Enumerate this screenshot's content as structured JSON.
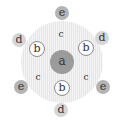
{
  "diagram": {
    "type": "hexagonal-cluster",
    "colors": {
      "a_fill": "#9b9b9b",
      "b_fill": "#ffffff",
      "b_stroke": "#8a8a8a",
      "d_fill": "#d6d6d6",
      "e_fill": "#b4b4b4",
      "background_ring": "#ececec"
    },
    "center": {
      "label": "a",
      "x": 62,
      "y": 62,
      "r": 12
    },
    "b_nodes": [
      {
        "label": "b",
        "x": 37,
        "y": 49,
        "r": 8
      },
      {
        "label": "b",
        "x": 86,
        "y": 48,
        "r": 8
      },
      {
        "label": "b",
        "x": 62,
        "y": 88,
        "r": 8
      }
    ],
    "c_labels": [
      {
        "label": "c",
        "x": 61,
        "y": 34
      },
      {
        "label": "c",
        "x": 38,
        "y": 77
      },
      {
        "label": "c",
        "x": 86,
        "y": 77
      }
    ],
    "d_nodes": [
      {
        "label": "d",
        "x": 19,
        "y": 40,
        "r": 7
      },
      {
        "label": "d",
        "x": 102,
        "y": 38,
        "r": 7
      },
      {
        "label": "d",
        "x": 61,
        "y": 110,
        "r": 7
      }
    ],
    "e_nodes": [
      {
        "label": "e",
        "x": 62,
        "y": 13,
        "r": 7
      },
      {
        "label": "e",
        "x": 21,
        "y": 87,
        "r": 7
      },
      {
        "label": "e",
        "x": 103,
        "y": 87,
        "r": 7
      }
    ]
  }
}
